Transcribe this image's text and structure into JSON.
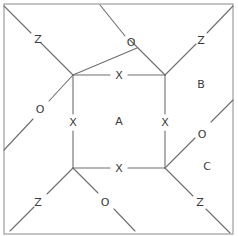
{
  "figure": {
    "title": "",
    "canvas": {
      "width": 238,
      "height": 236
    },
    "colors": {
      "background": "#ffffff",
      "stroke": "#6e6e6e",
      "border": "#8a8a8a",
      "label": "#3a3a3a"
    },
    "border": {
      "x": 4,
      "y": 4,
      "width": 229,
      "height": 230
    },
    "inner_square": {
      "corners": {
        "top_left": {
          "x": 73,
          "y": 75
        },
        "top_right": {
          "x": 165,
          "y": 75
        },
        "bottom_left": {
          "x": 73,
          "y": 168
        },
        "bottom_right": {
          "x": 165,
          "y": 168
        }
      }
    },
    "edges": [
      {
        "name": "inner-top-left-segment",
        "x1": 73,
        "y1": 75,
        "x2": 110,
        "y2": 75
      },
      {
        "name": "inner-top-right-segment",
        "x1": 128,
        "y1": 75,
        "x2": 165,
        "y2": 75
      },
      {
        "name": "inner-bottom-left-segment",
        "x1": 73,
        "y1": 168,
        "x2": 110,
        "y2": 168
      },
      {
        "name": "inner-bottom-right-segment",
        "x1": 128,
        "y1": 168,
        "x2": 165,
        "y2": 168
      },
      {
        "name": "inner-left-upper-segment",
        "x1": 73,
        "y1": 75,
        "x2": 73,
        "y2": 114
      },
      {
        "name": "inner-left-lower-segment",
        "x1": 73,
        "y1": 131,
        "x2": 73,
        "y2": 168
      },
      {
        "name": "inner-right-upper-segment",
        "x1": 165,
        "y1": 75,
        "x2": 165,
        "y2": 114
      },
      {
        "name": "inner-right-lower-segment",
        "x1": 165,
        "y1": 131,
        "x2": 165,
        "y2": 168
      },
      {
        "name": "diagonal-top-left-to-corner-upper",
        "x1": 73,
        "y1": 75,
        "x2": 41,
        "y2": 43
      },
      {
        "name": "diagonal-top-left-to-corner-lower",
        "x1": 31,
        "y1": 33,
        "x2": 4,
        "y2": 6
      },
      {
        "name": "diagonal-top-left-to-left-edge-upper",
        "x1": 73,
        "y1": 75,
        "x2": 49,
        "y2": 101
      },
      {
        "name": "diagonal-top-left-to-left-edge-lower",
        "x1": 33,
        "y1": 119,
        "x2": 4,
        "y2": 150
      },
      {
        "name": "diagonal-top-left-to-top-edge-upper",
        "x1": 73,
        "y1": 75,
        "x2": 137,
        "y2": 48
      },
      {
        "name": "diagonal-top-left-to-top-edge-lower",
        "x1": 125,
        "y1": 36,
        "x2": 100,
        "y2": 5
      },
      {
        "name": "diagonal-top-right-to-corner-lower",
        "x1": 165,
        "y1": 75,
        "x2": 196,
        "y2": 44
      },
      {
        "name": "diagonal-top-right-to-corner-upper",
        "x1": 207,
        "y1": 33,
        "x2": 233,
        "y2": 6
      },
      {
        "name": "diagonal-top-right-to-top-edge",
        "x1": 165,
        "y1": 75,
        "x2": 130,
        "y2": 40
      },
      {
        "name": "diagonal-bottom-left-to-corner-upper",
        "x1": 73,
        "y1": 168,
        "x2": 47,
        "y2": 194
      },
      {
        "name": "diagonal-bottom-left-to-corner-lower",
        "x1": 34,
        "y1": 207,
        "x2": 10,
        "y2": 231
      },
      {
        "name": "diagonal-bottom-left-to-bottom-edge-upper",
        "x1": 73,
        "y1": 168,
        "x2": 98,
        "y2": 193
      },
      {
        "name": "diagonal-bottom-left-to-bottom-edge-lower",
        "x1": 114,
        "y1": 209,
        "x2": 135,
        "y2": 231
      },
      {
        "name": "diagonal-bottom-right-to-right-edge-upper",
        "x1": 165,
        "y1": 168,
        "x2": 195,
        "y2": 138
      },
      {
        "name": "diagonal-bottom-right-to-right-edge-lower",
        "x1": 211,
        "y1": 122,
        "x2": 233,
        "y2": 100
      },
      {
        "name": "diagonal-bottom-right-to-corner-upper",
        "x1": 165,
        "y1": 168,
        "x2": 193,
        "y2": 196
      },
      {
        "name": "diagonal-bottom-right-to-corner-lower",
        "x1": 206,
        "y1": 209,
        "x2": 230,
        "y2": 233
      }
    ],
    "labels": [
      {
        "id": "z-top-left",
        "text": "Z",
        "x": 38,
        "y": 40
      },
      {
        "id": "o-top-center",
        "text": "O",
        "x": 131,
        "y": 43
      },
      {
        "id": "z-top-right",
        "text": "Z",
        "x": 201,
        "y": 41
      },
      {
        "id": "x-top",
        "text": "X",
        "x": 119,
        "y": 76
      },
      {
        "id": "b-region",
        "text": "B",
        "x": 201,
        "y": 85
      },
      {
        "id": "o-left",
        "text": "O",
        "x": 40,
        "y": 110
      },
      {
        "id": "x-left",
        "text": "X",
        "x": 73,
        "y": 123
      },
      {
        "id": "a-region",
        "text": "A",
        "x": 119,
        "y": 122
      },
      {
        "id": "x-right",
        "text": "X",
        "x": 165,
        "y": 123
      },
      {
        "id": "o-right",
        "text": "O",
        "x": 202,
        "y": 135
      },
      {
        "id": "x-bottom",
        "text": "X",
        "x": 119,
        "y": 169
      },
      {
        "id": "c-region",
        "text": "C",
        "x": 207,
        "y": 167
      },
      {
        "id": "z-bottom-left",
        "text": "Z",
        "x": 38,
        "y": 203
      },
      {
        "id": "o-bottom-center",
        "text": "O",
        "x": 105,
        "y": 203
      },
      {
        "id": "z-bottom-right",
        "text": "Z",
        "x": 200,
        "y": 203
      }
    ]
  }
}
